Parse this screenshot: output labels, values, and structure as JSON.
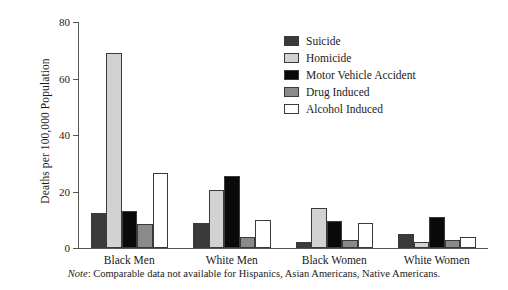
{
  "chart_data": {
    "type": "bar",
    "title": "",
    "subtitle": "",
    "xlabel": "",
    "ylabel": "Deaths per 100,000 Population",
    "categories": [
      "Black Men",
      "White Men",
      "Black Women",
      "White Women"
    ],
    "yticks": [
      0,
      20,
      40,
      60,
      80
    ],
    "ylim": [
      0,
      80
    ],
    "grid": false,
    "legend_position": "upper-right-inside",
    "series": [
      {
        "name": "Suicide",
        "color": "#3a3a3a",
        "values": [
          12.5,
          9.0,
          2.0,
          5.0
        ]
      },
      {
        "name": "Homicide",
        "color": "#d2d2d2",
        "values": [
          69.0,
          20.5,
          14.0,
          2.0
        ]
      },
      {
        "name": "Motor Vehicle Accident",
        "color": "#0a0a0a",
        "values": [
          13.0,
          25.5,
          9.5,
          11.0
        ]
      },
      {
        "name": "Drug Induced",
        "color": "#8a8a8a",
        "values": [
          8.5,
          4.0,
          3.0,
          3.0
        ]
      },
      {
        "name": "Alcohol Induced",
        "color": "#ffffff",
        "values": [
          26.5,
          10.0,
          9.0,
          4.0
        ]
      }
    ],
    "annotations": [
      "Note: Comparable data not available for Hispanics, Asian Americans, Native Americans."
    ]
  },
  "note": {
    "label": "Note",
    "separator": ": ",
    "text": "Comparable data not available for Hispanics, Asian Americans, Native Americans."
  }
}
